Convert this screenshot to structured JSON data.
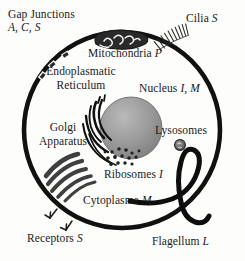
{
  "figure": {
    "background_color": "#fdfdfb",
    "ink_color": "#111111"
  },
  "labels": {
    "gap_junctions": {
      "name": "Gap Junctions",
      "codes": "A, C, S"
    },
    "cilia": {
      "name": "Cilia",
      "codes": "S"
    },
    "mitochondria": {
      "name": "Mitochondria",
      "codes": "P"
    },
    "endoplasmatic_reticulum": {
      "line1": "Endoplasmatic",
      "line2": "Reticulum",
      "codes": ""
    },
    "nucleus": {
      "name": "Nucleus",
      "codes": "I, M"
    },
    "golgi_apparatus": {
      "line1": "Golgi",
      "line2": "Apparatus",
      "codes": ""
    },
    "lysosomes": {
      "name": "Lysosomes",
      "codes": ""
    },
    "ribosomes": {
      "name": "Ribosomes",
      "codes": "I"
    },
    "cytoplasma": {
      "name": "Cytoplasma",
      "codes": "M"
    },
    "receptors": {
      "name": "Receptors",
      "codes": "S"
    },
    "flagellum": {
      "name": "Flagellum",
      "codes": "L"
    }
  },
  "structures": [
    {
      "id": "cell-membrane",
      "label": "cell membrane",
      "shape": "thick-circle"
    },
    {
      "id": "gap-junction-marks",
      "label": "gap junction gaps",
      "shape": "membrane-breaks"
    },
    {
      "id": "cilia-tuft",
      "label": "cilia",
      "shape": "hair-bundle"
    },
    {
      "id": "mitochondrion",
      "label": "mitochondrion",
      "shape": "dark-oval-with-cristae"
    },
    {
      "id": "nucleus-sphere",
      "label": "nucleus",
      "shape": "shaded-sphere"
    },
    {
      "id": "er-strands",
      "label": "endoplasmatic reticulum",
      "shape": "curved-strands"
    },
    {
      "id": "golgi-stack",
      "label": "golgi apparatus",
      "shape": "stacked-cisternae"
    },
    {
      "id": "lysosome-body",
      "label": "lysosome",
      "shape": "small-dark-circle"
    },
    {
      "id": "ribosome-dots",
      "label": "ribosomes",
      "shape": "scattered-dots"
    },
    {
      "id": "receptor-forks",
      "label": "receptors",
      "shape": "y-forks"
    },
    {
      "id": "flagellum-tail",
      "label": "flagellum",
      "shape": "thick-wavy-tail"
    }
  ]
}
